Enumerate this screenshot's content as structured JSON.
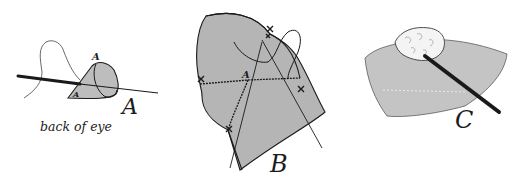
{
  "figure": {
    "panels": [
      {
        "id": "A",
        "label": "A",
        "point_labels": [
          "A",
          "A"
        ],
        "caption": "back of eye"
      },
      {
        "id": "B",
        "label": "B",
        "point_labels": [
          "A"
        ]
      },
      {
        "id": "C",
        "label": "C"
      }
    ],
    "colors": {
      "tissue_fill": "#b9b9b9",
      "tissue_fill_light": "#c8c8c8",
      "ink": "#1a1a1a",
      "cotton": "#f4f4f4",
      "background": "#ffffff"
    }
  }
}
